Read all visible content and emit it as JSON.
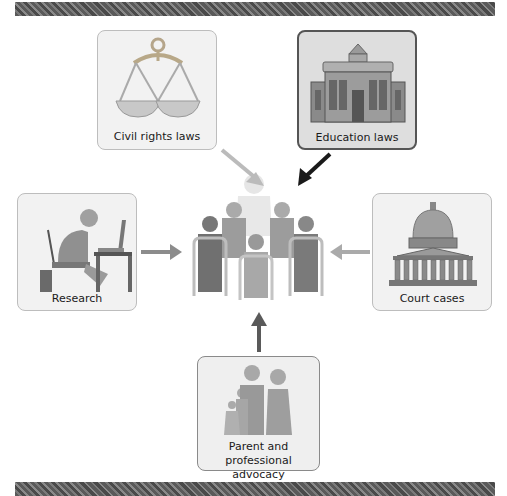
{
  "diagram": {
    "center": {
      "name": "classroom",
      "icon": "classroom-icon"
    },
    "nodes": [
      {
        "id": "civil-rights-laws",
        "label": "Civil rights laws",
        "icon": "scales-of-justice-icon",
        "position": "top-left",
        "arrow_color": "#bbbbbb"
      },
      {
        "id": "education-laws",
        "label": "Education laws",
        "icon": "government-building-icon",
        "position": "top-right",
        "arrow_color": "#1a1a1a"
      },
      {
        "id": "research",
        "label": "Research",
        "icon": "researcher-at-desk-icon",
        "position": "left",
        "arrow_color": "#8c8c8c"
      },
      {
        "id": "court-cases",
        "label": "Court cases",
        "icon": "capitol-dome-icon",
        "position": "right",
        "arrow_color": "#aaaaaa"
      },
      {
        "id": "parent-advocacy",
        "label_line1": "Parent and",
        "label_line2": "professional advocacy",
        "icon": "family-icon",
        "position": "bottom",
        "arrow_color": "#5a5a5a"
      }
    ]
  }
}
